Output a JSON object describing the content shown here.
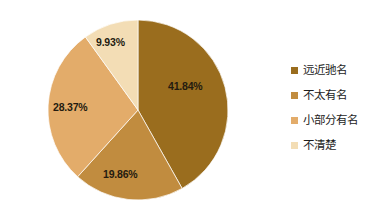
{
  "chart_data": {
    "type": "pie",
    "title": "",
    "xlabel": "",
    "ylabel": "",
    "legend_position": "right",
    "grid": false,
    "categories": [
      "远近驰名",
      "不太有名",
      "小部分有名",
      "不清楚"
    ],
    "values": [
      41.84,
      19.86,
      28.37,
      9.93
    ],
    "value_labels": [
      "41.84%",
      "19.86%",
      "28.37%",
      "9.93%"
    ],
    "colors": [
      "#9a6d1e",
      "#c18c3f",
      "#e3ac6a",
      "#f3ddb5"
    ],
    "slices": [
      {
        "label": "远近驰名",
        "value": 41.84,
        "value_label": "41.84%",
        "color": "#9a6d1e"
      },
      {
        "label": "不太有名",
        "value": 19.86,
        "value_label": "19.86%",
        "color": "#c18c3f"
      },
      {
        "label": "小部分有名",
        "value": 28.37,
        "value_label": "28.37%",
        "color": "#e3ac6a"
      },
      {
        "label": "不清楚",
        "value": 9.93,
        "value_label": "9.93%",
        "color": "#f3ddb5"
      }
    ]
  },
  "legend": {
    "items": [
      {
        "label": "远近驰名",
        "color": "#9a6d1e"
      },
      {
        "label": "不太有名",
        "color": "#c18c3f"
      },
      {
        "label": "小部分有名",
        "color": "#e3ac6a"
      },
      {
        "label": "不清楚",
        "color": "#f3ddb5"
      }
    ]
  }
}
